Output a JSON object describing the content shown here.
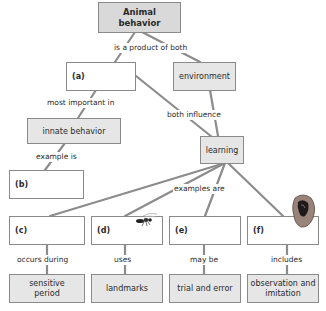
{
  "root": {
    "label": "Animal\nbehavior",
    "line1": "Animal",
    "line2": "behavior"
  },
  "links": {
    "product": "is a product of both",
    "most_important": "most important in",
    "both_influence": "both influence",
    "example_is": "example is",
    "examples_are": "examples are",
    "occurs_during": "occurs during",
    "uses": "uses",
    "may_be": "may be",
    "includes": "includes"
  },
  "nodes": {
    "a": "(a)",
    "environment": "environment",
    "innate": "innate behavior",
    "learning": "learning",
    "b": "(b)",
    "c": "(c)",
    "d": "(d)",
    "e": "(e)",
    "f": "(f)",
    "sensitive_line1": "sensitive",
    "sensitive_line2": "period",
    "landmarks": "landmarks",
    "trial": "trial and error",
    "observation_line1": "observation and",
    "observation_line2": "imitation"
  },
  "colors": {
    "line": "#8c8c8c",
    "box_fill": "#e6e6e6",
    "root_fill": "#d9d9d9",
    "border": "#8a8a8a"
  },
  "icons": [
    "wasp-icon",
    "ear-icon"
  ]
}
